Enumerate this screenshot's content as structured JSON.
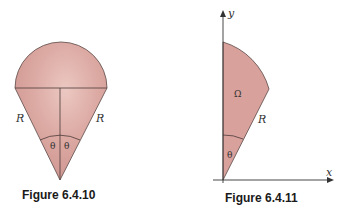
{
  "figures": [
    {
      "caption": "Figure 6.4.10",
      "labels": {
        "left_side": "R",
        "right_side": "R",
        "angle_left": "θ",
        "angle_right": "θ"
      }
    },
    {
      "caption": "Figure 6.4.11",
      "labels": {
        "y_axis": "y",
        "x_axis": "x",
        "region": "Ω",
        "side": "R",
        "angle": "θ"
      }
    }
  ],
  "colors": {
    "fill": "#d9a19c",
    "fill_light": "#e9c3bd",
    "stroke": "#5a4a48",
    "axis": "#333333"
  }
}
